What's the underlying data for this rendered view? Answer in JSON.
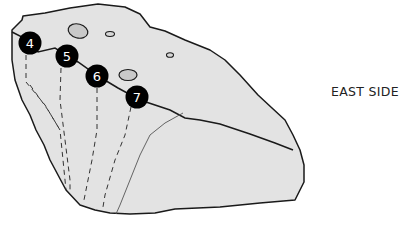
{
  "diagram": {
    "side_label": "EAST SIDE",
    "colors": {
      "rock_fill": "#e3e3e3",
      "outline": "#1a1a1a",
      "hold_fill": "#c9c9c9",
      "marker_fill": "#000000",
      "marker_text": "#ffffff"
    },
    "routes": [
      {
        "number": "4"
      },
      {
        "number": "5"
      },
      {
        "number": "6"
      },
      {
        "number": "7"
      }
    ]
  }
}
